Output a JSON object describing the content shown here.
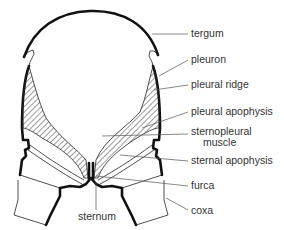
{
  "diagram": {
    "labels": [
      {
        "id": "tergum",
        "text": "tergum",
        "x": 191,
        "y": 37
      },
      {
        "id": "pleuron",
        "text": "pleuron",
        "x": 191,
        "y": 63
      },
      {
        "id": "pleural-ridge",
        "text": "pleural ridge",
        "x": 191,
        "y": 88
      },
      {
        "id": "pleural-apophysis",
        "text": "pleural apophysis",
        "x": 191,
        "y": 115
      },
      {
        "id": "sternopleural-muscle-1",
        "text": "sternopleural",
        "x": 191,
        "y": 135
      },
      {
        "id": "sternopleural-muscle-2",
        "text": "muscle",
        "x": 203,
        "y": 146
      },
      {
        "id": "sternal-apophysis",
        "text": "sternal apophysis",
        "x": 191,
        "y": 164
      },
      {
        "id": "furca",
        "text": "furca",
        "x": 191,
        "y": 189
      },
      {
        "id": "coxa",
        "text": "coxa",
        "x": 191,
        "y": 214
      },
      {
        "id": "sternum",
        "text": "sternum",
        "x": 78,
        "y": 220
      }
    ],
    "colors": {
      "outline": "#111111",
      "text": "#333333",
      "leader": "#555555",
      "background": "#ffffff"
    }
  }
}
